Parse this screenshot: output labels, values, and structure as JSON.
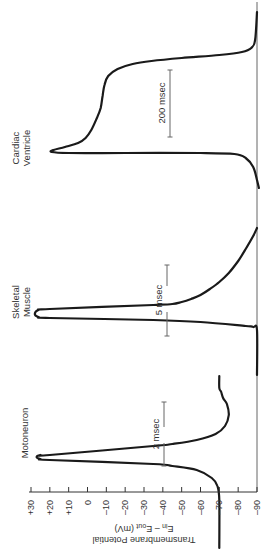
{
  "chart_data": {
    "type": "line",
    "orientation": "rotated-90-ccw",
    "title": "",
    "ylabel": "Transmembrane Potential",
    "ylabel_line2": "E_in − E_out (mV)",
    "ylabel_line2_parts": {
      "e1": "E",
      "sub1": "in",
      "mid": " – E",
      "sub2": "out",
      "tail": " (mV)"
    },
    "xlabel": "",
    "ylim": [
      -90,
      30
    ],
    "yticks": [
      30,
      20,
      10,
      0,
      -10,
      -20,
      -30,
      -40,
      -50,
      -60,
      -70,
      -80,
      -90
    ],
    "ytick_labels": [
      "+30",
      "+20",
      "+10",
      "0",
      "–10",
      "–20",
      "–30",
      "–40",
      "–50",
      "–60",
      "–70",
      "–80",
      "–90"
    ],
    "grid": false,
    "reference_line_mv": -90,
    "series": [
      {
        "name": "Motoneuron",
        "scale_bar": "2 msec",
        "resting_mv": -70,
        "peak_mv": 25,
        "undershoot_mv": -75,
        "points": [
          [
            -70,
            548
          ],
          [
            -70,
            500
          ],
          [
            -69,
            486
          ],
          [
            -66,
            478
          ],
          [
            -58,
            470
          ],
          [
            -45,
            466
          ],
          [
            -35,
            464
          ],
          [
            20,
            460
          ],
          [
            25,
            459
          ],
          [
            27,
            457
          ],
          [
            25,
            455
          ],
          [
            20,
            455
          ],
          [
            -35,
            446
          ],
          [
            -45,
            444
          ],
          [
            -58,
            440
          ],
          [
            -68,
            434
          ],
          [
            -73,
            426
          ],
          [
            -75,
            415
          ],
          [
            -74,
            404
          ],
          [
            -72,
            398
          ],
          [
            -71,
            392
          ],
          [
            -70,
            388
          ],
          [
            -70,
            376
          ]
        ]
      },
      {
        "name": "Skeletal Muscle",
        "scale_bar": "5 msec",
        "resting_mv": -90,
        "peak_mv": 27,
        "points": [
          [
            -90,
            375
          ],
          [
            -90,
            330
          ],
          [
            -88,
            327
          ],
          [
            -84,
            326
          ],
          [
            -60,
            322
          ],
          [
            -35,
            320
          ],
          [
            20,
            318
          ],
          [
            26,
            317
          ],
          [
            28,
            314
          ],
          [
            26,
            310
          ],
          [
            20,
            309
          ],
          [
            -35,
            305
          ],
          [
            -45,
            304
          ],
          [
            -50,
            302
          ],
          [
            -55,
            299
          ],
          [
            -60,
            295
          ],
          [
            -65,
            289
          ],
          [
            -70,
            282
          ],
          [
            -75,
            273
          ],
          [
            -80,
            261
          ],
          [
            -84,
            249
          ],
          [
            -88,
            236
          ],
          [
            -90,
            228
          ]
        ]
      },
      {
        "name": "Cardiac Ventricle",
        "scale_bar": "200 msec",
        "resting_mv": -90,
        "peak_mv": 20,
        "plateau_mv": 0,
        "points": [
          [
            -91,
            188
          ],
          [
            -90,
            180
          ],
          [
            -88,
            167
          ],
          [
            -84,
            158
          ],
          [
            -78,
            154
          ],
          [
            -60,
            153
          ],
          [
            -20,
            153
          ],
          [
            10,
            153
          ],
          [
            19,
            152
          ],
          [
            18,
            150
          ],
          [
            12,
            147
          ],
          [
            5,
            143
          ],
          [
            1,
            138
          ],
          [
            -2,
            130
          ],
          [
            -5,
            118
          ],
          [
            -7,
            108
          ],
          [
            -8,
            96
          ],
          [
            -9,
            85
          ],
          [
            -11,
            76
          ],
          [
            -16,
            69
          ],
          [
            -24,
            64
          ],
          [
            -34,
            61
          ],
          [
            -50,
            58
          ],
          [
            -70,
            55
          ],
          [
            -82,
            52
          ],
          [
            -87,
            48
          ],
          [
            -89,
            40
          ],
          [
            -90,
            12
          ]
        ]
      }
    ],
    "scale_bars": [
      {
        "label": "2 msec",
        "length_ms": 2
      },
      {
        "label": "5 msec",
        "length_ms": 5
      },
      {
        "label": "200 msec",
        "length_ms": 200
      }
    ]
  },
  "layout": {
    "axis": {
      "y": 492,
      "x_at_plus30": 31,
      "x_at_minus90": 257,
      "tick_len": 5,
      "label_y": 500
    },
    "ref_line": {
      "x": 257,
      "y1": 2,
      "y2": 492
    },
    "scale_bar_geom": [
      {
        "x": 164,
        "y1": 402,
        "y2": 466,
        "gap_y1": 427,
        "gap_y2": 443,
        "text_x": 155,
        "text_y": 434
      },
      {
        "x": 167,
        "y1": 265,
        "y2": 336,
        "gap_y1": 286,
        "gap_y2": 312,
        "text_x": 158,
        "text_y": 300
      },
      {
        "x": 170,
        "y1": 70,
        "y2": 137,
        "gap_y1": 0,
        "gap_y2": 0,
        "text_x": 161,
        "text_y": 103
      }
    ],
    "labels": [
      {
        "lines": [
          "Motoneuron"
        ],
        "x": 25,
        "y": 433
      },
      {
        "lines": [
          "Skeletal",
          "Muscle"
        ],
        "x": 20,
        "y": 302
      },
      {
        "lines": [
          "Cardiac",
          "Ventricle"
        ],
        "x": 20,
        "y": 148
      }
    ]
  }
}
